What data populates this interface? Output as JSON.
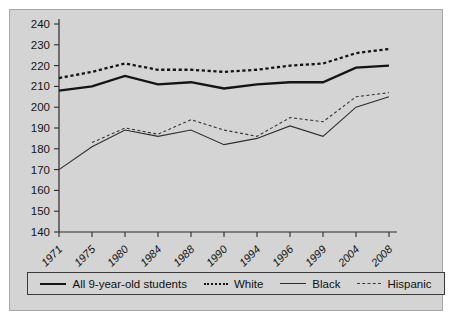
{
  "chart_data": {
    "type": "line",
    "title": "",
    "subtitle": "",
    "xlabel": "",
    "ylabel": "",
    "grid": false,
    "legend_position": "bottom",
    "categories": [
      "1971",
      "1975",
      "1980",
      "1984",
      "1988",
      "1990",
      "1994",
      "1996",
      "1999",
      "2004",
      "2008"
    ],
    "ylim": [
      140,
      240
    ],
    "yticks": [
      140,
      150,
      160,
      170,
      180,
      190,
      200,
      210,
      220,
      230,
      240
    ],
    "series": [
      {
        "name": "All 9-year-old students",
        "style": "solid-thick",
        "values": [
          208,
          210,
          215,
          211,
          212,
          209,
          211,
          212,
          212,
          219,
          220
        ]
      },
      {
        "name": "White",
        "style": "dashed-thick",
        "values": [
          214,
          217,
          221,
          218,
          218,
          217,
          218,
          220,
          221,
          226,
          228
        ]
      },
      {
        "name": "Black",
        "style": "solid-thin",
        "values": [
          170,
          181,
          189,
          186,
          189,
          182,
          185,
          191,
          186,
          200,
          205
        ]
      },
      {
        "name": "Hispanic",
        "style": "dashed-thin",
        "values": [
          null,
          183,
          190,
          187,
          194,
          189,
          186,
          195,
          193,
          205,
          207
        ]
      }
    ]
  },
  "legend": {
    "entries": [
      {
        "label": "All 9-year-old students"
      },
      {
        "label": "White"
      },
      {
        "label": "Black"
      },
      {
        "label": "Hispanic"
      }
    ]
  }
}
